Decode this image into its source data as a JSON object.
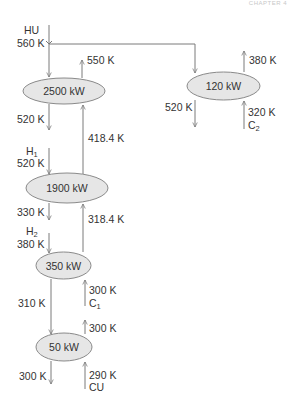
{
  "header": {
    "chapter_label": "CHAPTER 4"
  },
  "colors": {
    "line": "#7a7a7a",
    "ellipse_fill": "#e6e6e6",
    "ellipse_stroke": "#8a8a8a",
    "text": "#333333"
  },
  "exchangers": [
    {
      "id": "hx1",
      "duty": "2500 kW"
    },
    {
      "id": "hx2",
      "duty": "120 kW"
    },
    {
      "id": "hx3",
      "duty": "1900 kW"
    },
    {
      "id": "hx4",
      "duty": "350 kW"
    },
    {
      "id": "hx5",
      "duty": "50 kW"
    }
  ],
  "streams": {
    "hu": {
      "name": "HU",
      "inlet_temp": "560 K"
    },
    "h1": {
      "name": "H",
      "sub": "1",
      "inlet_temp": "520 K"
    },
    "h2": {
      "name": "H",
      "sub": "2",
      "inlet_temp": "380 K"
    },
    "c1": {
      "name": "C",
      "sub": "1",
      "inlet_temp": "300 K"
    },
    "c2": {
      "name": "C",
      "sub": "2",
      "inlet_temp": "320 K"
    },
    "cu": {
      "name": "CU",
      "inlet_temp": "290 K"
    }
  },
  "temperatures": {
    "hx1_hot_out": "520 K",
    "hx1_cold_out": "550 K",
    "hx1_cold_in": "418.4 K",
    "hx2_hot_out": "520 K",
    "hx2_cold_out": "380 K",
    "hx3_hot_out": "330 K",
    "hx3_cold_in": "318.4 K",
    "hx4_hot_out": "310 K",
    "hx5_hot_out": "300 K",
    "hx5_cold_out": "300 K"
  }
}
